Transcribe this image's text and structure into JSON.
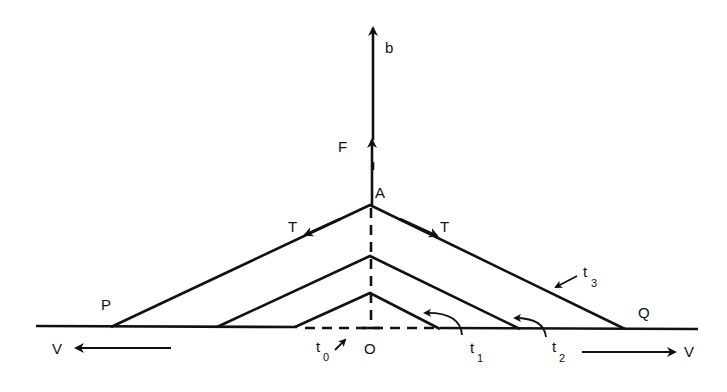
{
  "diagram": {
    "type": "force diagram of string with moving kinks",
    "colors": {
      "ink": "#111111",
      "background": "#ffffff"
    },
    "labels": {
      "b": "b",
      "F": "F",
      "A": "A",
      "T_left": "T",
      "T_right": "T",
      "P": "P",
      "Q": "Q",
      "O": "O",
      "V_left": "V",
      "V_right": "V",
      "t0": "t",
      "t0_sub": "0",
      "t1": "t",
      "t1_sub": "1",
      "t2": "t",
      "t2_sub": "2",
      "t3": "t",
      "t3_sub": "3"
    },
    "elements": [
      "baseline (string at rest)",
      "vertical arrow b (velocity of pulled point)",
      "force arrow F at apex A",
      "tension arrows T along both string segments",
      "three nested triangular string shapes at times t1, t2, t3",
      "dashed vertical line through O",
      "dashed baseline between inner kinks",
      "kink velocity arrows V left and V right"
    ]
  }
}
